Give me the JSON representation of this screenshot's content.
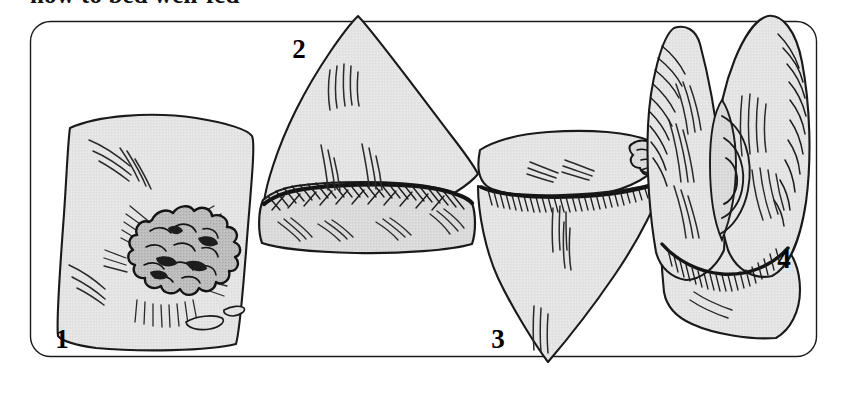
{
  "figure": {
    "caption_clipped": "how to bed well-fed",
    "type": "line-drawing instructional sequence",
    "panel_count": 4,
    "frame": {
      "shape": "rounded-rectangle",
      "x": 30,
      "y": 21,
      "width": 787,
      "height": 336,
      "corner_radius": 20,
      "stroke": "#1a1a1a",
      "stroke_width": 1.3,
      "fill": "none"
    },
    "colors": {
      "ink": "#1a1a1a",
      "cloth_fill": "#e2e2e2",
      "cloth_fill_shadow": "#cfcfcf",
      "food_fill": "#b9b9b9",
      "page": "#ffffff"
    },
    "steps": [
      {
        "number": "1",
        "label_x": 62,
        "label_y": 348,
        "description": "Square cloth laid flat with a mound of food heaped near the centre",
        "state": "cloth flat, food piled on"
      },
      {
        "number": "2",
        "label_x": 299,
        "label_y": 58,
        "description": "Cloth folded upward into a triangle over the food, gathered along the base",
        "state": "first fold up"
      },
      {
        "number": "3",
        "label_x": 498,
        "label_y": 348,
        "description": "Cloth folded down into an inverted triangle, bunched at the top edge",
        "state": "second fold down"
      },
      {
        "number": "4",
        "label_x": 784,
        "label_y": 268,
        "description": "Corners drawn together and twisted closed into a finished bundle",
        "state": "gathered bundle"
      }
    ]
  }
}
